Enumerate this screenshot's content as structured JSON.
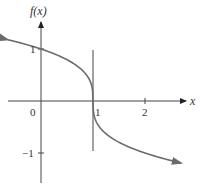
{
  "chart_data": {
    "type": "line",
    "title": "",
    "xlabel": "x",
    "ylabel": "f(x)",
    "function": "f(x) = -∛(x - 1)",
    "x_tick_labels": [
      "0",
      "1",
      "2"
    ],
    "y_tick_labels": [
      "1",
      "−1"
    ],
    "xlim": [
      -0.65,
      2.85
    ],
    "ylim": [
      -1.6,
      1.6
    ],
    "grid": false,
    "legend": null,
    "annotations": [
      "vertical line at x = 1 (vertical tangent)"
    ],
    "series": [
      {
        "name": "f(x)",
        "x": [
          -0.6,
          -0.25,
          0,
          0.5,
          0.875,
          0.99,
          1,
          1.01,
          1.125,
          1.5,
          2,
          2.5,
          2.7
        ],
        "values": [
          1.17,
          1.08,
          1.0,
          0.79,
          0.5,
          0.22,
          0,
          -0.22,
          -0.5,
          -0.79,
          -1.0,
          -1.14,
          -1.19
        ]
      }
    ],
    "colors": {
      "curve": "#6b6b6b",
      "axes": "#333333",
      "vertical_line": "#444444"
    }
  },
  "labels": {
    "y_axis": "f(x)",
    "x_axis": "x",
    "origin": "0",
    "x_one": "1",
    "x_two": "2",
    "y_one": "1",
    "y_neg_one": "−1"
  }
}
